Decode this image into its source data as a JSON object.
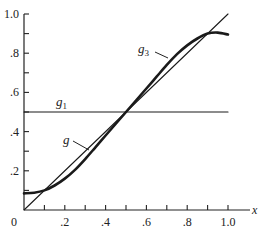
{
  "chart_data": {
    "type": "line",
    "title": "",
    "xlabel": "x",
    "ylabel": "",
    "xlim": [
      0,
      1.0
    ],
    "ylim": [
      0,
      1.0
    ],
    "grid": false,
    "x_ticks": [
      0,
      0.1,
      0.2,
      0.3,
      0.4,
      0.5,
      0.6,
      0.7,
      0.8,
      0.9,
      1.0
    ],
    "x_tick_labels": [
      "0",
      ".2",
      ".4",
      ".6",
      ".8",
      "1.0"
    ],
    "x_tick_label_values": [
      0,
      0.2,
      0.4,
      0.6,
      0.8,
      1.0
    ],
    "y_ticks": [
      0.1,
      0.2,
      0.3,
      0.4,
      0.5,
      0.6,
      0.7,
      0.8,
      0.9,
      1.0
    ],
    "y_tick_labels": [
      ".2",
      ".4",
      ".6",
      ".8",
      "1.0"
    ],
    "y_tick_label_values": [
      0.2,
      0.4,
      0.6,
      0.8,
      1.0
    ],
    "series": [
      {
        "name": "y = x",
        "label": "",
        "style": "thin",
        "x": [
          0,
          1.0
        ],
        "y": [
          0,
          1.0
        ]
      },
      {
        "name": "g1",
        "label": "g",
        "subscript": "1",
        "style": "thin",
        "x": [
          0,
          1.0
        ],
        "y": [
          0.5,
          0.5
        ]
      },
      {
        "name": "g",
        "label": "g",
        "subscript": "",
        "style": "thick",
        "x": [
          0,
          0.05,
          0.1,
          0.15,
          0.2,
          0.25,
          0.3,
          0.35,
          0.4,
          0.45,
          0.5,
          0.55,
          0.6,
          0.65,
          0.7,
          0.75,
          0.8,
          0.85,
          0.9,
          0.95,
          1.0
        ],
        "y": [
          0.085,
          0.088,
          0.1,
          0.125,
          0.16,
          0.205,
          0.26,
          0.32,
          0.38,
          0.44,
          0.5,
          0.56,
          0.62,
          0.68,
          0.74,
          0.795,
          0.84,
          0.875,
          0.9,
          0.905,
          0.895
        ]
      }
    ],
    "annotations": [
      {
        "text": "g",
        "subscript": "1",
        "target": "g1",
        "x": 0.15,
        "y": 0.52
      },
      {
        "text": "g",
        "subscript": "",
        "target": "g",
        "x": 0.2,
        "y": 0.36,
        "leader": true
      },
      {
        "text": "g",
        "subscript": "3",
        "target": "g",
        "x": 0.55,
        "y": 0.8,
        "leader": true
      }
    ]
  },
  "labels": {
    "origin": "0",
    "x_axis": "x",
    "g1_main": "g",
    "g1_sub": "1",
    "g_main": "g",
    "g3_main": "g",
    "g3_sub": "3"
  }
}
